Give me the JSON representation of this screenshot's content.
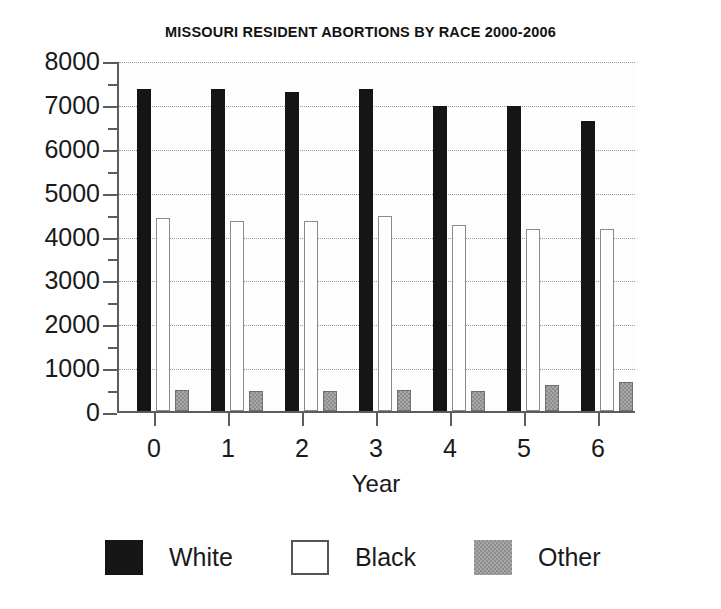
{
  "chart_data": {
    "type": "bar",
    "title": "MISSOURI RESIDENT ABORTIONS BY RACE 2000-2006",
    "xlabel": "Year",
    "ylabel": "",
    "categories": [
      "0",
      "1",
      "2",
      "3",
      "4",
      "5",
      "6"
    ],
    "series": [
      {
        "name": "White",
        "color": "#151515",
        "values": [
          7340,
          7340,
          7270,
          7340,
          6950,
          6950,
          6610
        ]
      },
      {
        "name": "Black",
        "color": "#ffffff",
        "values": [
          4400,
          4320,
          4320,
          4450,
          4230,
          4150,
          4150
        ]
      },
      {
        "name": "Other",
        "color": "#8e8e8e",
        "values": [
          470,
          450,
          450,
          480,
          460,
          600,
          650
        ]
      }
    ],
    "ylim": [
      0,
      8000
    ],
    "ytick_labels": [
      "8000",
      "7000",
      "6000",
      "5000",
      "4000",
      "3000",
      "2000",
      "1000",
      "0"
    ],
    "ytick_values": [
      8000,
      7000,
      6000,
      5000,
      4000,
      3000,
      2000,
      1000,
      0
    ],
    "yminor_step": 500,
    "grid": true,
    "grid_style": "dotted",
    "legend_position": "bottom",
    "legend": [
      "White",
      "Black",
      "Other"
    ]
  },
  "legend": {
    "white_label": "White",
    "black_label": "Black",
    "other_label": "Other"
  },
  "axes": {
    "x_title": "Year"
  }
}
